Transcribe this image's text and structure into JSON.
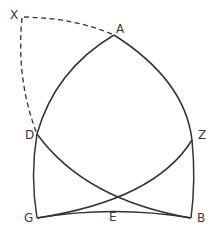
{
  "figure": {
    "points": [
      {
        "id": "X",
        "label": "X"
      },
      {
        "id": "A",
        "label": "A"
      },
      {
        "id": "D",
        "label": "D"
      },
      {
        "id": "Z",
        "label": "Z"
      },
      {
        "id": "G",
        "label": "G"
      },
      {
        "id": "E",
        "label": "E"
      },
      {
        "id": "B",
        "label": "B"
      }
    ],
    "arcs": [
      {
        "from": "X",
        "to": "A",
        "style": "dashed"
      },
      {
        "from": "X",
        "to": "D",
        "style": "dashed"
      },
      {
        "from": "A",
        "to": "D",
        "style": "solid"
      },
      {
        "from": "A",
        "to": "B",
        "style": "solid"
      },
      {
        "from": "D",
        "to": "B",
        "style": "solid",
        "through": "E"
      },
      {
        "from": "Z",
        "to": "G",
        "style": "solid",
        "through": "E"
      },
      {
        "from": "G",
        "to": "B",
        "style": "solid",
        "through": "E"
      },
      {
        "from": "D",
        "to": "G",
        "style": "solid"
      }
    ],
    "colors": {
      "stroke": "#333333",
      "label": "#3a3a3a",
      "background": "#ffffff"
    }
  }
}
